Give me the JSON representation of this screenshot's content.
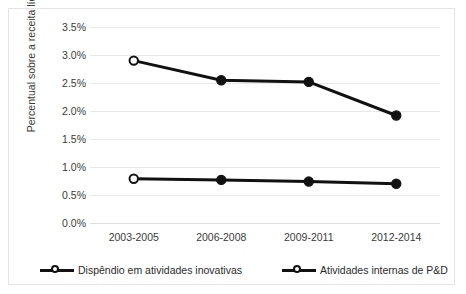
{
  "chart_data": {
    "type": "line",
    "title": "",
    "xlabel": "",
    "ylabel": "Percentual sobre a receita líquida",
    "categories": [
      "2003-2005",
      "2006-2008",
      "2009-2011",
      "2012-2014"
    ],
    "ylim": [
      0.0,
      3.5
    ],
    "ytick_step": 0.5,
    "ytick_labels": [
      "0.0%",
      "0.5%",
      "1.0%",
      "1.5%",
      "2.0%",
      "2.5%",
      "3.0%",
      "3.5%"
    ],
    "ytick_values": [
      0.0,
      0.5,
      1.0,
      1.5,
      2.0,
      2.5,
      3.0,
      3.5
    ],
    "grid": true,
    "legend_position": "bottom",
    "series": [
      {
        "name": "Dispêndio em atividades inovativas",
        "values": [
          2.9,
          2.55,
          2.52,
          1.92
        ],
        "color": "#111111",
        "marker": "circle",
        "first_marker_filled": false
      },
      {
        "name": "Atividades internas de P&D",
        "values": [
          0.79,
          0.77,
          0.74,
          0.7
        ],
        "color": "#111111",
        "marker": "circle",
        "first_marker_filled": false
      }
    ]
  },
  "legend": {
    "items": [
      {
        "label": "Dispêndio em atividades inovativas",
        "marker": "hollow-circle-line-marker"
      },
      {
        "label": "Atividades internas de P&D",
        "marker": "hollow-circle-line-marker"
      }
    ]
  },
  "colors": {
    "series_line": "#111111",
    "gridline": "#e8e8e8",
    "baseline": "#dedede",
    "frame": "#e4e4e4",
    "text": "#3a3a3a",
    "background": "#ffffff"
  }
}
